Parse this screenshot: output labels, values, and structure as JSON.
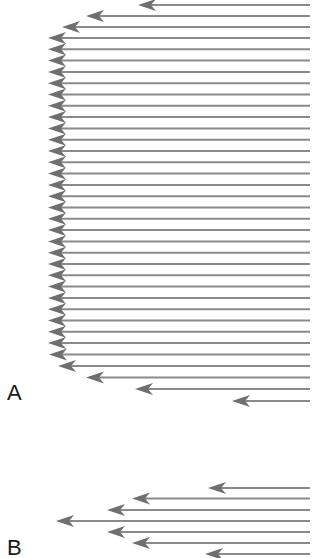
{
  "figure": {
    "colors": {
      "line": "#8a8a8a",
      "arrowhead": "#6f6f6f",
      "label": "#1a1a1a",
      "background": "#ffffff"
    },
    "line_end_x": 310
  },
  "panels": [
    {
      "id": "A",
      "label": "A",
      "profile": "plug flow (blunt profile)",
      "arrows": [
        {
          "y": 5,
          "tip_x": 138
        },
        {
          "y": 16,
          "tip_x": 86
        },
        {
          "y": 27,
          "tip_x": 62
        },
        {
          "y": 38,
          "tip_x": 48
        },
        {
          "y": 49.3,
          "tip_x": 48
        },
        {
          "y": 60.6,
          "tip_x": 48
        },
        {
          "y": 71.9,
          "tip_x": 48
        },
        {
          "y": 83.2,
          "tip_x": 48
        },
        {
          "y": 94.5,
          "tip_x": 48
        },
        {
          "y": 105.8,
          "tip_x": 48
        },
        {
          "y": 117.1,
          "tip_x": 48
        },
        {
          "y": 128.4,
          "tip_x": 48
        },
        {
          "y": 139.7,
          "tip_x": 48
        },
        {
          "y": 151,
          "tip_x": 48
        },
        {
          "y": 162.3,
          "tip_x": 48
        },
        {
          "y": 173.6,
          "tip_x": 48
        },
        {
          "y": 184.9,
          "tip_x": 48
        },
        {
          "y": 196.2,
          "tip_x": 48
        },
        {
          "y": 207.5,
          "tip_x": 48
        },
        {
          "y": 218.8,
          "tip_x": 48
        },
        {
          "y": 230.1,
          "tip_x": 48
        },
        {
          "y": 241.4,
          "tip_x": 48
        },
        {
          "y": 252.7,
          "tip_x": 48
        },
        {
          "y": 264,
          "tip_x": 48
        },
        {
          "y": 275.3,
          "tip_x": 48
        },
        {
          "y": 286.6,
          "tip_x": 48
        },
        {
          "y": 297.9,
          "tip_x": 48
        },
        {
          "y": 309.2,
          "tip_x": 48
        },
        {
          "y": 320.5,
          "tip_x": 48
        },
        {
          "y": 331.8,
          "tip_x": 48
        },
        {
          "y": 343.1,
          "tip_x": 48
        },
        {
          "y": 354.4,
          "tip_x": 49
        },
        {
          "y": 366,
          "tip_x": 58
        },
        {
          "y": 377.5,
          "tip_x": 86
        },
        {
          "y": 389,
          "tip_x": 135
        },
        {
          "y": 401,
          "tip_x": 232
        }
      ]
    },
    {
      "id": "B",
      "label": "B",
      "profile": "parabolic flow",
      "arrows": [
        {
          "y": 488,
          "tip_x": 208
        },
        {
          "y": 498.5,
          "tip_x": 132
        },
        {
          "y": 510,
          "tip_x": 107
        },
        {
          "y": 521,
          "tip_x": 56
        },
        {
          "y": 532,
          "tip_x": 107
        },
        {
          "y": 543,
          "tip_x": 132
        },
        {
          "y": 554,
          "tip_x": 205
        }
      ]
    }
  ]
}
